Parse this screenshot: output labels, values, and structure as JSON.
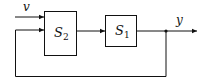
{
  "diagram": {
    "type": "block-diagram",
    "blocks": [
      {
        "id": "S2",
        "label": "S",
        "sub": "2"
      },
      {
        "id": "S1",
        "label": "S",
        "sub": "1"
      }
    ],
    "signals": {
      "input": "v",
      "output": "y"
    },
    "connections": [
      {
        "from": "v",
        "to": "S2"
      },
      {
        "from": "S2",
        "to": "S1"
      },
      {
        "from": "S1",
        "to": "y"
      },
      {
        "from": "y",
        "to": "S2",
        "kind": "feedback"
      }
    ]
  }
}
